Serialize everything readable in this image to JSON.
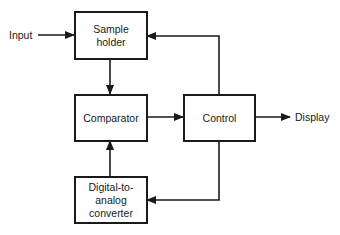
{
  "diagram": {
    "type": "block-diagram",
    "colors": {
      "line": "#1a1a1a",
      "background": "#ffffff"
    },
    "inputs": {
      "input_label": "Input"
    },
    "outputs": {
      "display_label": "Display"
    },
    "blocks": {
      "sample_holder": {
        "line1": "Sample",
        "line2": "holder"
      },
      "comparator": {
        "line1": "Comparator"
      },
      "control": {
        "line1": "Control"
      },
      "dac": {
        "line1": "Digital-to-",
        "line2": "analog",
        "line3": "converter"
      }
    },
    "connections": [
      {
        "from": "Input",
        "to": "Sample holder"
      },
      {
        "from": "Sample holder",
        "to": "Comparator"
      },
      {
        "from": "Comparator",
        "to": "Control"
      },
      {
        "from": "Control",
        "to": "Display"
      },
      {
        "from": "Control",
        "to": "Sample holder"
      },
      {
        "from": "Control",
        "to": "Digital-to-analog converter"
      },
      {
        "from": "Digital-to-analog converter",
        "to": "Comparator"
      }
    ]
  }
}
